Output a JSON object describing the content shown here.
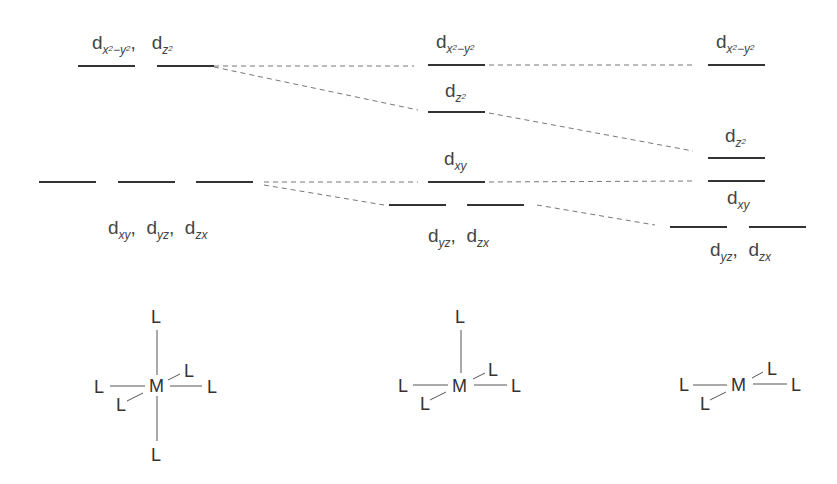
{
  "diagram": {
    "columns": [
      {
        "name": "octahedral",
        "upper_label": {
          "d": "d",
          "parts": [
            {
              "sub": "x",
              "sup": "2",
              "rest": "−y",
              "sup2": "2"
            },
            {
              "sub": "z",
              "sup": "2"
            }
          ],
          "text": "dx²−y², dz²"
        },
        "lower_label": {
          "text": "dxy, dyz, dzx"
        },
        "ligands": {
          "top": "L",
          "bottom": "L",
          "left": "L",
          "right": "L",
          "front": "L",
          "back": "L",
          "metal": "M"
        }
      },
      {
        "name": "square-pyramidal",
        "labels": {
          "x2y2": "dx²−y²",
          "z2": "dz²",
          "xy": "dxy",
          "yz_zx": "dyz, dzx"
        },
        "ligands": {
          "top": "L",
          "left": "L",
          "right": "L",
          "front": "L",
          "back": "L",
          "metal": "M"
        }
      },
      {
        "name": "square-planar",
        "labels": {
          "x2y2": "dx²−y²",
          "z2": "dz²",
          "xy": "dxy",
          "yz_zx": "dyz, dzx"
        },
        "ligands": {
          "left": "L",
          "right": "L",
          "front": "L",
          "back": "L",
          "metal": "M"
        }
      }
    ]
  },
  "text": {
    "d": "d",
    "comma": ",",
    "sub_x": "x",
    "sub_y": "y",
    "sub_z": "z",
    "sup_2": "2",
    "minus": "−",
    "sub_xy": "xy",
    "sub_yz": "yz",
    "sub_zx": "zx",
    "L": "L",
    "M": "M"
  }
}
